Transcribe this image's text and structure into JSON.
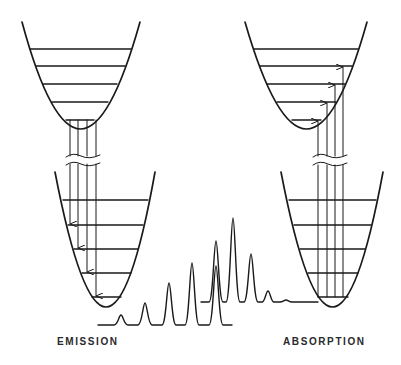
{
  "diagram": {
    "type": "franck-condon-energy-level-diagram",
    "colors": {
      "line": "#1a1a1a",
      "background": "#ffffff"
    },
    "labels": {
      "emission": "EMISSION",
      "absorption": "ABSORPTION"
    },
    "panels": [
      {
        "name": "emission",
        "upper_well": {
          "vibrational_levels": 5,
          "transitions_from": "lowest level"
        },
        "lower_well": {
          "vibrational_levels": 5
        },
        "transitions": {
          "count": 4,
          "direction": "down",
          "arrowheads_on": "lower well levels"
        }
      },
      {
        "name": "absorption",
        "upper_well": {
          "vibrational_levels": 5
        },
        "lower_well": {
          "vibrational_levels": 5,
          "transitions_from": "lowest level"
        },
        "transitions": {
          "count": 4,
          "direction": "up",
          "arrowheads_on": "upper well levels"
        }
      }
    ],
    "spectra": [
      {
        "name": "emission-spectrum",
        "peaks": 5,
        "trend": "increasing toward center"
      },
      {
        "name": "absorption-spectrum",
        "peaks": 5,
        "trend": "decreasing away from center"
      }
    ],
    "axis_break_symbol": "wavy double line between wells"
  }
}
